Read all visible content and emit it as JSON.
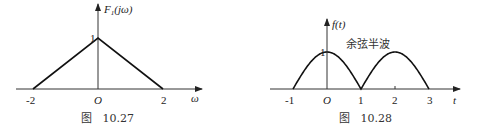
{
  "chart_data": [
    {
      "type": "line",
      "title": "",
      "ylabel": "F1(jω)",
      "xlabel": "ω",
      "origin_label": "O",
      "x_ticks": [
        "-2",
        "2"
      ],
      "y_ticks": [
        "1"
      ],
      "xlim": [
        -2,
        2
      ],
      "ylim": [
        0,
        1
      ],
      "series": [
        {
          "name": "F1(jω)",
          "x": [
            -2,
            0,
            2
          ],
          "y": [
            0,
            1,
            0
          ]
        }
      ],
      "caption": "图   10.27",
      "grid": false,
      "legend": "none"
    },
    {
      "type": "line",
      "title": "",
      "ylabel": "f(t)",
      "xlabel": "t",
      "origin_label": "O",
      "x_ticks": [
        "-1",
        "1",
        "2",
        "3"
      ],
      "y_ticks": [
        "1"
      ],
      "xlim": [
        -1,
        3
      ],
      "ylim": [
        0,
        1
      ],
      "annotation": "余弦半波",
      "series": [
        {
          "name": "f(t)",
          "description": "half-wave cosine pulses, period 2",
          "x": [
            -1,
            0,
            1,
            2,
            3
          ],
          "y": [
            0,
            1,
            0,
            1,
            0
          ]
        }
      ],
      "caption": "图   10.28",
      "grid": false,
      "legend": "none"
    }
  ]
}
